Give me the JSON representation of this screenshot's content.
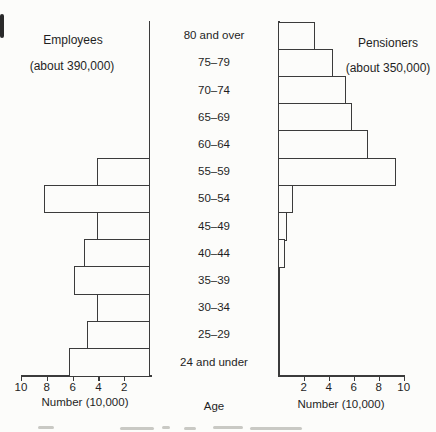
{
  "figure": {
    "left_title": "Employees",
    "left_subtitle": "(about 390,000)",
    "right_title": "Pensioners",
    "right_subtitle": "(about 350,000)",
    "left_axis_label": "Number (10,000)",
    "right_axis_label": "Number (10,000)",
    "age_axis_label": "Age"
  },
  "chart_data": {
    "type": "bar",
    "subtype": "population-pyramid",
    "title": "",
    "categories": [
      "80 and over",
      "75–79",
      "70–74",
      "65–69",
      "60–64",
      "55–59",
      "50–54",
      "45–49",
      "40–44",
      "35–39",
      "30–34",
      "25–29",
      "24 and under"
    ],
    "series": [
      {
        "name": "Employees",
        "side": "left",
        "total_label": "about 390,000",
        "values": [
          0,
          0,
          0,
          0,
          0,
          4.0,
          8.1,
          4.0,
          5.0,
          5.8,
          4.0,
          4.8,
          6.2
        ]
      },
      {
        "name": "Pensioners",
        "side": "right",
        "total_label": "about 350,000",
        "values": [
          2.8,
          4.3,
          5.3,
          5.8,
          7.1,
          9.3,
          1.1,
          0.6,
          0.45,
          0,
          0,
          0,
          0
        ]
      }
    ],
    "xlabel": "Number (10,000)",
    "center_axis_label": "Age",
    "xlim": [
      0,
      10
    ],
    "left_ticks": [
      10,
      8,
      6,
      4,
      2
    ],
    "right_ticks": [
      2,
      4,
      6,
      8,
      10
    ],
    "grid": false,
    "bar_fill": "#fcfcfa",
    "line_color": "#3b3b3b"
  }
}
